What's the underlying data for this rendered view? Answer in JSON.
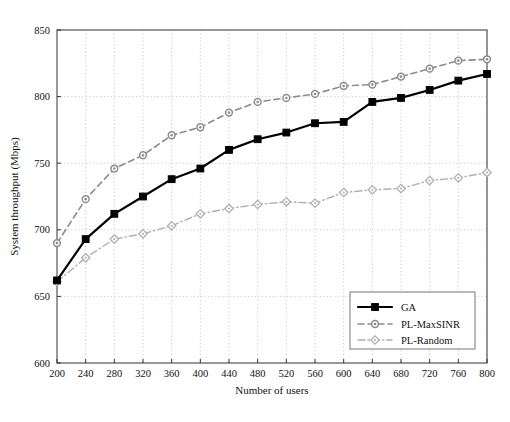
{
  "figure": {
    "background": "#ffffff",
    "frame_color": "#555555",
    "grid_color": "#bbbbbb"
  },
  "chart_data": {
    "type": "line",
    "title": "",
    "xlabel": "Number of users",
    "ylabel": "System throughput (Mbps)",
    "xlim": [
      200,
      800
    ],
    "ylim": [
      600,
      850
    ],
    "xticks": [
      200,
      240,
      280,
      320,
      360,
      400,
      440,
      480,
      520,
      560,
      600,
      640,
      680,
      720,
      760,
      800
    ],
    "yticks": [
      600,
      650,
      700,
      750,
      800,
      850
    ],
    "grid": true,
    "grid_style": "dotted",
    "legend_position": "lower right",
    "x": [
      200,
      240,
      280,
      320,
      360,
      400,
      440,
      480,
      520,
      560,
      600,
      640,
      680,
      720,
      760,
      800
    ],
    "series": [
      {
        "name": "GA",
        "color": "#000000",
        "marker": "square-filled",
        "linestyle": "solid",
        "linewidth": 2.2,
        "values": [
          662,
          693,
          712,
          725,
          738,
          746,
          760,
          768,
          773,
          780,
          781,
          796,
          799,
          805,
          812,
          817
        ]
      },
      {
        "name": "PL-MaxSINR",
        "color": "#8c8c8c",
        "marker": "circle-open",
        "linestyle": "dashed",
        "linewidth": 1.6,
        "values": [
          690,
          723,
          746,
          756,
          771,
          777,
          788,
          796,
          799,
          802,
          808,
          809,
          815,
          821,
          827,
          828
        ]
      },
      {
        "name": "PL-Random",
        "color": "#b0b0b0",
        "marker": "diamond-open",
        "linestyle": "dashdot",
        "linewidth": 1.4,
        "values": [
          661,
          679,
          693,
          697,
          703,
          712,
          716,
          719,
          721,
          720,
          728,
          730,
          731,
          737,
          739,
          743
        ]
      }
    ]
  },
  "legend": {
    "items": [
      {
        "label": "GA"
      },
      {
        "label": "PL-MaxSINR"
      },
      {
        "label": "PL-Random"
      }
    ]
  },
  "caption": {
    "text": ""
  }
}
